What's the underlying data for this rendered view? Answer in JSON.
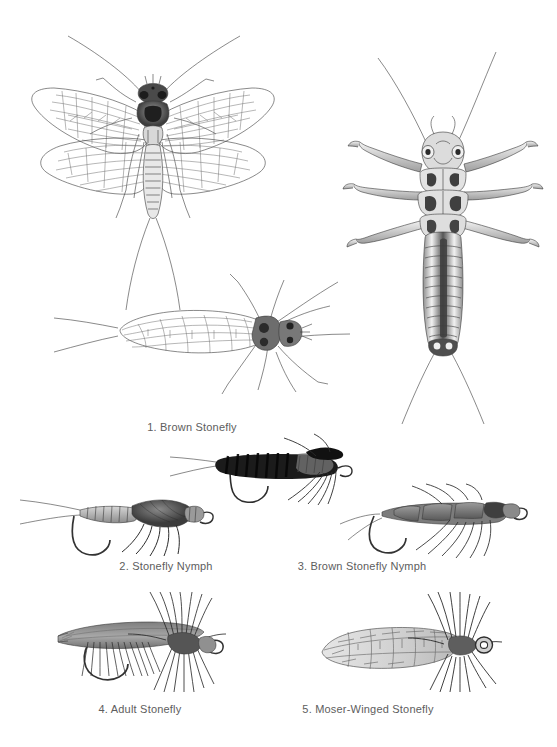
{
  "page": {
    "background_color": "#ffffff",
    "ink_color": "#3a3a3a",
    "caption_color": "#5d5d5d"
  },
  "figures": [
    {
      "id": "brown-stonefly-adult-dorsal",
      "label": "",
      "kind": "scientific-illustration",
      "subject": "adult brown stonefly, dorsal view, wings spread"
    },
    {
      "id": "brown-stonefly-nymph-dorsal",
      "label": "",
      "kind": "scientific-illustration",
      "subject": "stonefly nymph, dorsal view"
    },
    {
      "id": "brown-stonefly-adult-folded",
      "label": "",
      "kind": "scientific-illustration",
      "subject": "adult brown stonefly, wings folded, lateral-dorsal view"
    }
  ],
  "captions": [
    {
      "id": "caption-1",
      "text": "1. Brown Stonefly",
      "x": 192,
      "y": 421
    },
    {
      "id": "caption-2",
      "text": "2. Stonefly Nymph",
      "x": 166,
      "y": 560
    },
    {
      "id": "caption-3",
      "text": "3. Brown Stonefly Nymph",
      "x": 362,
      "y": 560
    },
    {
      "id": "caption-4",
      "text": "4. Adult Stonefly",
      "x": 140,
      "y": 703
    },
    {
      "id": "caption-5",
      "text": "5. Moser-Winged Stonefly",
      "x": 368,
      "y": 703
    }
  ],
  "flies": [
    {
      "id": "fly-2",
      "name": "Stonefly Nymph",
      "number": "2"
    },
    {
      "id": "fly-3",
      "name": "Brown Stonefly Nymph",
      "number": "3"
    },
    {
      "id": "fly-dark-nymph",
      "name": "dark rubber-leg stonefly nymph",
      "number": ""
    },
    {
      "id": "fly-4",
      "name": "Adult Stonefly",
      "number": "4"
    },
    {
      "id": "fly-5",
      "name": "Moser-Winged Stonefly",
      "number": "5"
    }
  ]
}
